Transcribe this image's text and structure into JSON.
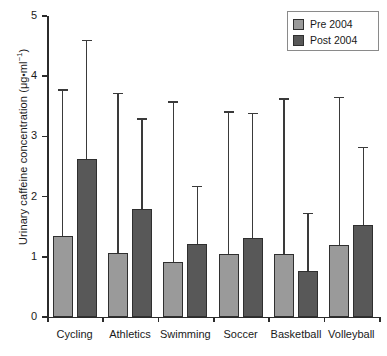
{
  "chart_data": {
    "type": "bar",
    "title": "",
    "xlabel": "",
    "ylabel": "Urinary caffeine concentration (μg•ml⁻¹)",
    "ylabel_parts": {
      "prefix": "Urinary caffeine concentration (μg",
      "separator": "•",
      "middle": "ml",
      "exponent": "−1",
      "suffix": ")"
    },
    "categories": [
      "Cycling",
      "Athletics",
      "Swimming",
      "Soccer",
      "Basketball",
      "Volleyball"
    ],
    "ylim": [
      0,
      5
    ],
    "yticks": [
      0,
      1,
      2,
      3,
      4,
      5
    ],
    "ytick_labels": [
      "0",
      "1",
      "2",
      "3",
      "4",
      "5"
    ],
    "grid": false,
    "legend_position": "top-right",
    "series": [
      {
        "name": "Pre 2004",
        "color": "#9a9a9a",
        "values": [
          1.34,
          1.07,
          0.92,
          1.05,
          1.04,
          1.2
        ],
        "error_upper": [
          3.78,
          3.72,
          3.58,
          3.42,
          3.63,
          3.66
        ]
      },
      {
        "name": "Post 2004",
        "color": "#585858",
        "values": [
          2.62,
          1.79,
          1.21,
          1.32,
          0.76,
          1.52
        ],
        "error_upper": [
          4.6,
          3.3,
          2.18,
          3.39,
          1.73,
          2.83
        ]
      }
    ]
  },
  "legend": {
    "items": [
      {
        "label": "Pre 2004",
        "color": "#9a9a9a"
      },
      {
        "label": "Post 2004",
        "color": "#585858"
      }
    ]
  },
  "colors": {
    "pre": "#9a9a9a",
    "post": "#585858",
    "axis": "#2b2b2b",
    "background": "#ffffff"
  }
}
